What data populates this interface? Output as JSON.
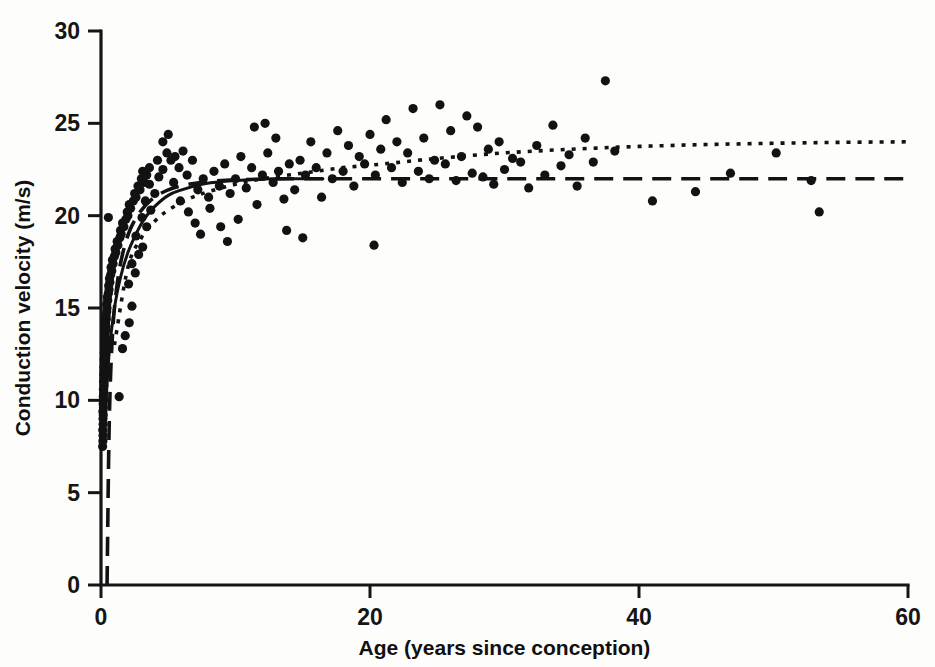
{
  "chart_data": {
    "type": "scatter",
    "title": "",
    "subtitle": "",
    "xlabel": "Age (years since conception)",
    "ylabel": "Conduction velocity (m/s)",
    "xlim": [
      0,
      60
    ],
    "ylim": [
      0,
      30
    ],
    "xticks": [
      0,
      20,
      40,
      60
    ],
    "yticks": [
      0,
      5,
      10,
      15,
      20,
      25,
      30
    ],
    "xtick_labels": [
      "0",
      "20",
      "40",
      "60"
    ],
    "ytick_labels": [
      "0",
      "5",
      "10",
      "15",
      "20",
      "25",
      "30"
    ],
    "grid": false,
    "legend": false,
    "legend_position": "none",
    "point_color": "#121212",
    "point_marker": "filled-circle",
    "axes_color": "#151515",
    "background_color": "#ffffff",
    "annotations": [],
    "series": [
      {
        "name": "Conduction velocity measurements",
        "type": "scatter",
        "marker": "filled-circle",
        "color": "#121212",
        "points": [
          [
            0.12,
            7.5
          ],
          [
            0.14,
            7.8
          ],
          [
            0.15,
            8.1
          ],
          [
            0.13,
            8.4
          ],
          [
            0.16,
            8.7
          ],
          [
            0.15,
            9.0
          ],
          [
            0.17,
            9.2
          ],
          [
            0.14,
            9.4
          ],
          [
            0.18,
            9.6
          ],
          [
            0.16,
            9.8
          ],
          [
            0.19,
            10.0
          ],
          [
            0.17,
            10.2
          ],
          [
            0.2,
            10.4
          ],
          [
            0.18,
            10.6
          ],
          [
            0.21,
            10.8
          ],
          [
            0.19,
            11.0
          ],
          [
            0.22,
            11.2
          ],
          [
            0.2,
            11.4
          ],
          [
            0.23,
            11.6
          ],
          [
            0.21,
            11.8
          ],
          [
            0.25,
            12.0
          ],
          [
            0.23,
            12.2
          ],
          [
            0.27,
            12.4
          ],
          [
            0.25,
            12.6
          ],
          [
            0.29,
            12.8
          ],
          [
            0.3,
            13.0
          ],
          [
            0.28,
            13.2
          ],
          [
            0.33,
            13.4
          ],
          [
            0.31,
            13.6
          ],
          [
            0.35,
            13.8
          ],
          [
            0.37,
            14.0
          ],
          [
            0.34,
            14.2
          ],
          [
            0.4,
            14.4
          ],
          [
            0.38,
            14.6
          ],
          [
            0.43,
            14.8
          ],
          [
            0.45,
            15.0
          ],
          [
            0.42,
            15.2
          ],
          [
            0.5,
            15.4
          ],
          [
            0.47,
            15.6
          ],
          [
            0.55,
            15.8
          ],
          [
            0.6,
            16.0
          ],
          [
            0.57,
            16.2
          ],
          [
            0.66,
            16.4
          ],
          [
            0.63,
            16.6
          ],
          [
            0.72,
            16.8
          ],
          [
            0.8,
            17.0
          ],
          [
            0.75,
            17.2
          ],
          [
            0.9,
            17.4
          ],
          [
            0.85,
            17.6
          ],
          [
            1.0,
            17.8
          ],
          [
            1.1,
            18.0
          ],
          [
            1.05,
            18.2
          ],
          [
            1.25,
            18.4
          ],
          [
            1.2,
            18.6
          ],
          [
            1.4,
            18.8
          ],
          [
            1.5,
            19.0
          ],
          [
            1.45,
            19.2
          ],
          [
            1.7,
            19.4
          ],
          [
            1.6,
            19.6
          ],
          [
            1.85,
            19.8
          ],
          [
            0.55,
            19.9
          ],
          [
            2.0,
            20.0
          ],
          [
            1.95,
            20.2
          ],
          [
            2.2,
            20.4
          ],
          [
            2.1,
            20.6
          ],
          [
            2.4,
            20.8
          ],
          [
            2.6,
            21.0
          ],
          [
            2.5,
            21.2
          ],
          [
            2.9,
            21.4
          ],
          [
            2.75,
            21.6
          ],
          [
            3.2,
            21.8
          ],
          [
            3.0,
            22.0
          ],
          [
            3.4,
            22.2
          ],
          [
            3.1,
            22.4
          ],
          [
            3.6,
            22.6
          ],
          [
            1.35,
            10.2
          ],
          [
            1.6,
            12.8
          ],
          [
            1.8,
            13.5
          ],
          [
            2.1,
            14.2
          ],
          [
            2.3,
            15.1
          ],
          [
            2.05,
            16.3
          ],
          [
            2.55,
            16.9
          ],
          [
            2.3,
            17.4
          ],
          [
            2.8,
            17.9
          ],
          [
            3.1,
            18.3
          ],
          [
            2.6,
            18.9
          ],
          [
            3.4,
            19.4
          ],
          [
            3.05,
            19.9
          ],
          [
            3.7,
            20.3
          ],
          [
            3.3,
            20.8
          ],
          [
            4.0,
            21.2
          ],
          [
            3.6,
            21.7
          ],
          [
            4.3,
            22.1
          ],
          [
            4.6,
            22.5
          ],
          [
            4.2,
            23.0
          ],
          [
            4.9,
            23.4
          ],
          [
            5.2,
            23.0
          ],
          [
            4.6,
            24.0
          ],
          [
            5.5,
            23.2
          ],
          [
            5.0,
            24.4
          ],
          [
            5.8,
            22.6
          ],
          [
            6.1,
            23.5
          ],
          [
            5.4,
            21.8
          ],
          [
            6.4,
            22.2
          ],
          [
            6.8,
            23.0
          ],
          [
            5.9,
            20.8
          ],
          [
            7.2,
            21.4
          ],
          [
            6.5,
            20.2
          ],
          [
            7.6,
            22.0
          ],
          [
            7.0,
            19.6
          ],
          [
            8.0,
            21.0
          ],
          [
            7.4,
            19.0
          ],
          [
            8.4,
            22.4
          ],
          [
            8.8,
            21.6
          ],
          [
            8.1,
            20.4
          ],
          [
            9.2,
            22.8
          ],
          [
            9.6,
            21.2
          ],
          [
            8.9,
            19.4
          ],
          [
            10.0,
            22.0
          ],
          [
            10.4,
            23.2
          ],
          [
            9.4,
            18.6
          ],
          [
            10.8,
            21.5
          ],
          [
            11.2,
            22.6
          ],
          [
            10.2,
            19.8
          ],
          [
            11.6,
            20.6
          ],
          [
            12.0,
            22.2
          ],
          [
            11.4,
            24.8
          ],
          [
            12.4,
            23.4
          ],
          [
            12.8,
            21.8
          ],
          [
            12.2,
            25.0
          ],
          [
            13.2,
            22.4
          ],
          [
            13.6,
            20.9
          ],
          [
            13.0,
            24.2
          ],
          [
            14.0,
            22.8
          ],
          [
            14.4,
            21.4
          ],
          [
            14.8,
            23.0
          ],
          [
            13.8,
            19.2
          ],
          [
            15.2,
            22.2
          ],
          [
            15.6,
            24.0
          ],
          [
            15.0,
            18.8
          ],
          [
            16.0,
            22.6
          ],
          [
            16.4,
            21.0
          ],
          [
            16.8,
            23.4
          ],
          [
            17.2,
            22.0
          ],
          [
            17.6,
            24.6
          ],
          [
            18.0,
            22.4
          ],
          [
            18.4,
            23.8
          ],
          [
            18.8,
            21.6
          ],
          [
            19.2,
            23.2
          ],
          [
            19.6,
            22.8
          ],
          [
            20.0,
            24.4
          ],
          [
            20.3,
            18.4
          ],
          [
            20.4,
            22.2
          ],
          [
            20.8,
            23.6
          ],
          [
            21.2,
            25.2
          ],
          [
            21.6,
            22.6
          ],
          [
            22.0,
            24.0
          ],
          [
            22.4,
            21.8
          ],
          [
            22.8,
            23.4
          ],
          [
            23.2,
            25.8
          ],
          [
            23.6,
            22.4
          ],
          [
            24.0,
            24.2
          ],
          [
            24.4,
            22.0
          ],
          [
            24.8,
            23.0
          ],
          [
            25.2,
            26.0
          ],
          [
            25.6,
            22.8
          ],
          [
            26.0,
            24.6
          ],
          [
            26.4,
            21.9
          ],
          [
            26.8,
            23.2
          ],
          [
            27.2,
            25.4
          ],
          [
            27.6,
            22.3
          ],
          [
            28.0,
            24.8
          ],
          [
            28.4,
            22.1
          ],
          [
            28.8,
            23.6
          ],
          [
            29.2,
            21.7
          ],
          [
            29.6,
            24.0
          ],
          [
            30.0,
            22.5
          ],
          [
            30.6,
            23.1
          ],
          [
            31.2,
            22.9
          ],
          [
            31.8,
            21.5
          ],
          [
            32.4,
            23.8
          ],
          [
            33.0,
            22.2
          ],
          [
            33.6,
            24.9
          ],
          [
            34.2,
            22.7
          ],
          [
            34.8,
            23.3
          ],
          [
            35.4,
            21.6
          ],
          [
            36.0,
            24.2
          ],
          [
            36.6,
            22.9
          ],
          [
            37.5,
            27.3
          ],
          [
            38.2,
            23.5
          ],
          [
            41.0,
            20.8
          ],
          [
            44.2,
            21.3
          ],
          [
            46.8,
            22.3
          ],
          [
            50.2,
            23.4
          ],
          [
            52.8,
            21.9
          ],
          [
            53.4,
            20.2
          ]
        ]
      }
    ],
    "curves": [
      {
        "name": "solid-fit-curve",
        "style": "solid",
        "color": "#121212",
        "description": "Rising saturating fit merging into plateau near 22 m/s",
        "points": [
          [
            0.3,
            9.0
          ],
          [
            0.6,
            12.5
          ],
          [
            1.0,
            15.0
          ],
          [
            1.5,
            16.8
          ],
          [
            2.0,
            18.0
          ],
          [
            2.6,
            19.0
          ],
          [
            3.2,
            19.8
          ],
          [
            4.0,
            20.5
          ],
          [
            5.0,
            21.1
          ],
          [
            6.0,
            21.4
          ],
          [
            7.5,
            21.7
          ],
          [
            9.0,
            21.85
          ],
          [
            11.0,
            21.95
          ],
          [
            13.0,
            22.0
          ],
          [
            15.0,
            22.0
          ],
          [
            16.5,
            22.0
          ]
        ]
      },
      {
        "name": "dotted-fit-curve",
        "style": "dotted",
        "color": "#121212",
        "description": "Slowly increasing fit from ~18 at age 2 to ~24 at age 60",
        "points": [
          [
            1.0,
            13.0
          ],
          [
            2.0,
            17.2
          ],
          [
            3.0,
            18.8
          ],
          [
            4.0,
            19.7
          ],
          [
            5.0,
            20.3
          ],
          [
            6.5,
            20.9
          ],
          [
            8.0,
            21.3
          ],
          [
            10.0,
            21.7
          ],
          [
            12.0,
            22.0
          ],
          [
            15.0,
            22.3
          ],
          [
            18.0,
            22.6
          ],
          [
            21.0,
            22.8
          ],
          [
            25.0,
            23.1
          ],
          [
            30.0,
            23.4
          ],
          [
            35.0,
            23.6
          ],
          [
            40.0,
            23.75
          ],
          [
            45.0,
            23.85
          ],
          [
            50.0,
            23.92
          ],
          [
            55.0,
            23.97
          ],
          [
            60.0,
            24.0
          ]
        ]
      },
      {
        "name": "dashed-plateau-curve",
        "style": "dashed",
        "color": "#121212",
        "description": "Steep rise from zero then constant plateau at 22 m/s",
        "points": [
          [
            0.45,
            0.0
          ],
          [
            0.5,
            3.0
          ],
          [
            0.55,
            6.0
          ],
          [
            0.62,
            9.0
          ],
          [
            0.72,
            11.5
          ],
          [
            0.85,
            13.5
          ],
          [
            1.0,
            15.0
          ],
          [
            1.3,
            16.8
          ],
          [
            1.7,
            18.2
          ],
          [
            2.2,
            19.3
          ],
          [
            2.9,
            20.2
          ],
          [
            3.8,
            20.9
          ],
          [
            5.0,
            21.4
          ],
          [
            6.5,
            21.7
          ],
          [
            8.5,
            21.88
          ],
          [
            11.0,
            21.96
          ],
          [
            14.0,
            22.0
          ],
          [
            20.0,
            22.0
          ],
          [
            30.0,
            22.0
          ],
          [
            40.0,
            22.0
          ],
          [
            50.0,
            22.0
          ],
          [
            60.0,
            22.0
          ]
        ]
      }
    ]
  }
}
